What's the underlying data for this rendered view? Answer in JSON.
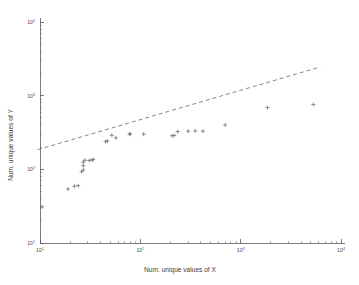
{
  "chart_data": {
    "type": "scatter",
    "title": "",
    "subtitle": "",
    "xlabel": "Num. unique values of X",
    "ylabel": "Num. unique values of Y",
    "xscale": "log",
    "yscale": "log",
    "xlim": [
      10,
      10000
    ],
    "ylim": [
      10,
      10000
    ],
    "grid": false,
    "legend": null,
    "marker": "plus",
    "marker_color": "#6b6b6b",
    "xticks": [
      10,
      100,
      1000,
      10000
    ],
    "yticks": [
      10,
      100,
      1000,
      10000
    ],
    "xticklabels": [
      "10^1",
      "10^2",
      "10^3",
      "10^4"
    ],
    "yticklabels": [
      "10^1",
      "10^2",
      "10^3",
      "10^4"
    ],
    "xtick_mantissa": [
      "10",
      "10",
      "10",
      "10"
    ],
    "xtick_exponent": [
      "1",
      "2",
      "3",
      "4"
    ],
    "ytick_mantissa": [
      "10",
      "10",
      "10",
      "10"
    ],
    "ytick_exponent": [
      "1",
      "2",
      "3",
      "4"
    ],
    "points": [
      {
        "x": 10.5,
        "y": 31
      },
      {
        "x": 19,
        "y": 54
      },
      {
        "x": 22,
        "y": 59
      },
      {
        "x": 24,
        "y": 60
      },
      {
        "x": 26,
        "y": 93
      },
      {
        "x": 27,
        "y": 98
      },
      {
        "x": 27,
        "y": 112
      },
      {
        "x": 27,
        "y": 125
      },
      {
        "x": 28,
        "y": 133
      },
      {
        "x": 31,
        "y": 132
      },
      {
        "x": 33,
        "y": 134
      },
      {
        "x": 34,
        "y": 136
      },
      {
        "x": 45,
        "y": 238
      },
      {
        "x": 47,
        "y": 243
      },
      {
        "x": 52,
        "y": 290
      },
      {
        "x": 57,
        "y": 268
      },
      {
        "x": 78,
        "y": 300
      },
      {
        "x": 79,
        "y": 303
      },
      {
        "x": 108,
        "y": 300
      },
      {
        "x": 207,
        "y": 286
      },
      {
        "x": 218,
        "y": 288
      },
      {
        "x": 236,
        "y": 325
      },
      {
        "x": 300,
        "y": 330
      },
      {
        "x": 352,
        "y": 332
      },
      {
        "x": 420,
        "y": 330
      },
      {
        "x": 700,
        "y": 400
      },
      {
        "x": 1850,
        "y": 690
      },
      {
        "x": 5300,
        "y": 760
      }
    ],
    "trend_line": {
      "style": "dashed",
      "color": "#6f6f6f",
      "x_start": 9.5,
      "y_start": 185,
      "x_end": 6200,
      "y_end": 2450
    }
  }
}
